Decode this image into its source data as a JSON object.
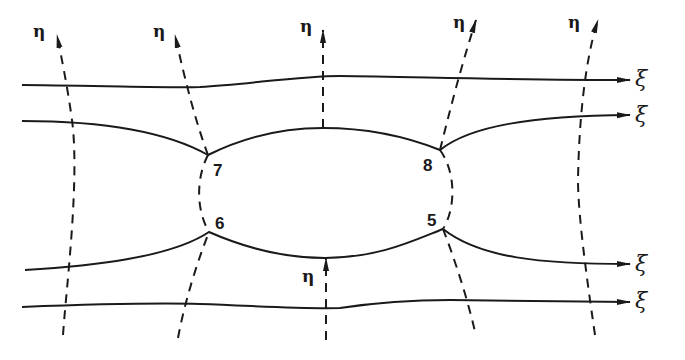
{
  "diagram": {
    "title": "",
    "stroke_color": "#1a1a1a",
    "background": "#ffffff",
    "axes_symbols": {
      "xi": "ξ",
      "eta": "η"
    },
    "xi_lines": [
      {
        "id": "xi-1",
        "label": "ξ",
        "label_pos": [
          633,
          68
        ]
      },
      {
        "id": "xi-2",
        "label": "ξ",
        "label_pos": [
          633,
          104
        ]
      },
      {
        "id": "xi-3",
        "label": "ξ",
        "label_pos": [
          633,
          253
        ]
      },
      {
        "id": "xi-4",
        "label": "ξ",
        "label_pos": [
          633,
          290
        ]
      }
    ],
    "eta_lines": [
      {
        "id": "eta-1",
        "label": "η",
        "label_pos": [
          33,
          23
        ]
      },
      {
        "id": "eta-2",
        "label": "η",
        "label_pos": [
          153,
          23
        ]
      },
      {
        "id": "eta-3",
        "label": "η",
        "label_pos": [
          300,
          18
        ]
      },
      {
        "id": "eta-4",
        "label": "η",
        "label_pos": [
          453,
          14
        ]
      },
      {
        "id": "eta-5",
        "label": "η",
        "label_pos": [
          568,
          14
        ]
      },
      {
        "id": "eta-6",
        "label": "η",
        "label_pos": [
          302,
          268
        ]
      }
    ],
    "nodes": [
      {
        "id": "node-7",
        "label": "7",
        "pos": [
          208,
          155
        ],
        "label_pos": [
          213,
          162
        ]
      },
      {
        "id": "node-8",
        "label": "8",
        "pos": [
          440,
          150
        ],
        "label_pos": [
          423,
          157
        ]
      },
      {
        "id": "node-6",
        "label": "6",
        "pos": [
          209,
          232
        ],
        "label_pos": [
          215,
          215
        ]
      },
      {
        "id": "node-5",
        "label": "5",
        "pos": [
          443,
          229
        ],
        "label_pos": [
          427,
          212
        ]
      }
    ]
  }
}
